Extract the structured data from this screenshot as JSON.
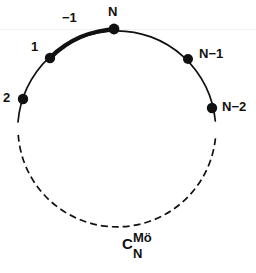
{
  "figure": {
    "background_color": "#ffffff",
    "ink_color": "#111111"
  },
  "caption": {
    "base": "C",
    "subscript": "N",
    "superscript": "Mö",
    "full_text": "C_N^Mö"
  },
  "circle": {
    "center_x": 117,
    "center_y": 128,
    "radius": 99,
    "solid_arc_from_deg": 180,
    "solid_arc_to_deg": 4,
    "dashed_arc_from_deg": 184,
    "dashed_arc_to_deg": 356,
    "bold_arc_from_deg": 132,
    "bold_arc_to_deg": 92
  },
  "nodes": [
    {
      "id": "node-n",
      "label": "N",
      "angle_deg": 90,
      "x": 114,
      "y": 29,
      "label_x": 108,
      "label_y": 6,
      "dot_radius": 5
    },
    {
      "id": "node-1",
      "label": "1",
      "angle_deg": 133,
      "x": 50,
      "y": 58,
      "label_x": 31,
      "label_y": 41,
      "dot_radius": 5
    },
    {
      "id": "node-2",
      "label": "2",
      "angle_deg": 163,
      "x": 23,
      "y": 99,
      "label_x": 3,
      "label_y": 92,
      "dot_radius": 5
    },
    {
      "id": "node-n-minus-1",
      "label": "N−1",
      "angle_deg": 45,
      "x": 188,
      "y": 59,
      "label_x": 199,
      "label_y": 48,
      "dot_radius": 5
    },
    {
      "id": "node-n-minus-2",
      "label": "N−2",
      "angle_deg": 12,
      "x": 212,
      "y": 108,
      "label_x": 222,
      "label_y": 101,
      "dot_radius": 5
    }
  ],
  "arc_labels": [
    {
      "id": "arc-label-minus-1",
      "label": "−1",
      "x": 62,
      "y": 12
    }
  ],
  "stroke_widths": {
    "thin": 1.7,
    "bold": 4.2,
    "dashed": 1.7
  },
  "dash_pattern": "7 4"
}
